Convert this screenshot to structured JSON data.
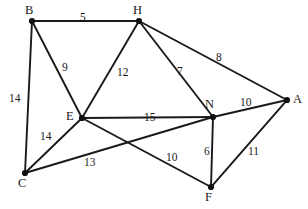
{
  "figure": {
    "kind": "weighted-undirected-graph",
    "width": 308,
    "height": 209,
    "background_color": "#ffffff",
    "line_color": "#1a1a1a",
    "node_color": "#111111",
    "text_color": "#1a1a1a"
  },
  "chart_data": {
    "type": "diagram",
    "title": "",
    "xlabel": "",
    "ylabel": "",
    "graph_type": "weighted undirected graph",
    "nodes": [
      {
        "id": "B",
        "label": "B",
        "x": 32,
        "y": 21,
        "label_x": 25,
        "label_y": 4
      },
      {
        "id": "H",
        "label": "H",
        "x": 139,
        "y": 21,
        "label_x": 133,
        "label_y": 4
      },
      {
        "id": "A",
        "label": "A",
        "x": 287,
        "y": 100,
        "label_x": 293,
        "label_y": 93
      },
      {
        "id": "E",
        "label": "E",
        "x": 82,
        "y": 118,
        "label_x": 66,
        "label_y": 110
      },
      {
        "id": "N",
        "label": "N",
        "x": 213,
        "y": 117,
        "label_x": 205,
        "label_y": 98
      },
      {
        "id": "C",
        "label": "C",
        "x": 25,
        "y": 173,
        "label_x": 18,
        "label_y": 177
      },
      {
        "id": "F",
        "label": "F",
        "x": 211,
        "y": 187,
        "label_x": 205,
        "label_y": 191
      }
    ],
    "edges": [
      {
        "from": "B",
        "to": "H",
        "weight": 5,
        "label_x": 80,
        "label_y": 12
      },
      {
        "from": "B",
        "to": "E",
        "weight": 9,
        "label_x": 62,
        "label_y": 62
      },
      {
        "from": "B",
        "to": "C",
        "weight": 14,
        "label_x": 9,
        "label_y": 93
      },
      {
        "from": "H",
        "to": "E",
        "weight": 12,
        "label_x": 117,
        "label_y": 67
      },
      {
        "from": "H",
        "to": "N",
        "weight": 7,
        "label_x": 177,
        "label_y": 66
      },
      {
        "from": "H",
        "to": "A",
        "weight": 8,
        "label_x": 216,
        "label_y": 52
      },
      {
        "from": "N",
        "to": "A",
        "weight": 10,
        "label_x": 240,
        "label_y": 97
      },
      {
        "from": "E",
        "to": "N",
        "weight": 15,
        "label_x": 144,
        "label_y": 112
      },
      {
        "from": "E",
        "to": "C",
        "weight": 14,
        "label_x": 40,
        "label_y": 131
      },
      {
        "from": "E",
        "to": "F",
        "weight": 10,
        "label_x": 166,
        "label_y": 152
      },
      {
        "from": "C",
        "to": "N",
        "weight": 13,
        "label_x": 84,
        "label_y": 157
      },
      {
        "from": "N",
        "to": "F",
        "weight": 6,
        "label_x": 204,
        "label_y": 146
      },
      {
        "from": "F",
        "to": "A",
        "weight": 11,
        "label_x": 248,
        "label_y": 146
      }
    ],
    "node_labels": [
      "B",
      "H",
      "A",
      "E",
      "N",
      "C",
      "F"
    ],
    "weights": [
      5,
      9,
      14,
      12,
      7,
      8,
      10,
      15,
      14,
      10,
      13,
      6,
      11
    ]
  }
}
